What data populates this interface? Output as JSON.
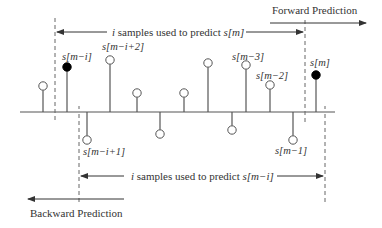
{
  "diagram": {
    "type": "stem-plot",
    "colors": {
      "line": "#555555",
      "dashed": "#666666",
      "text": "#333333",
      "filled_marker": "#000000",
      "hollow_marker": "#ffffff"
    },
    "top_arrow": {
      "label_prefix": "i",
      "label_text": " samples used to predict ",
      "label_target": "s[m]"
    },
    "bottom_arrow": {
      "label_prefix": "i",
      "label_text": " samples used to predict ",
      "label_target": "s[m−i]"
    },
    "forward_label": "Forward Prediction",
    "backward_label": "Backward Prediction",
    "sample_labels": {
      "s_m_minus_i": "s[m−i]",
      "s_m_minus_i_plus_2": "s[m−i+2]",
      "s_m_minus_i_plus_1": "s[m−i+1]",
      "s_m_minus_3": "s[m−3]",
      "s_m_minus_2": "s[m−2]",
      "s_m_minus_1": "s[m−1]",
      "s_m": "s[m]"
    },
    "samples": [
      {
        "x": 43,
        "y": 86,
        "filled": false
      },
      {
        "x": 67,
        "y": 67,
        "filled": true
      },
      {
        "x": 87,
        "y": 140,
        "filled": false
      },
      {
        "x": 110,
        "y": 60,
        "filled": false
      },
      {
        "x": 137,
        "y": 93,
        "filled": false
      },
      {
        "x": 160,
        "y": 134,
        "filled": false
      },
      {
        "x": 184,
        "y": 93,
        "filled": false
      },
      {
        "x": 208,
        "y": 63,
        "filled": false
      },
      {
        "x": 232,
        "y": 130,
        "filled": false
      },
      {
        "x": 246,
        "y": 65,
        "filled": false
      },
      {
        "x": 270,
        "y": 85,
        "filled": false
      },
      {
        "x": 293,
        "y": 140,
        "filled": false
      },
      {
        "x": 316,
        "y": 75,
        "filled": true
      }
    ]
  }
}
